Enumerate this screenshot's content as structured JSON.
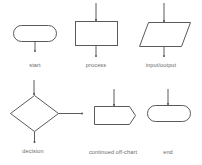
{
  "diagram": {
    "symbols": [
      {
        "id": "start",
        "label": "start",
        "shape": "terminal"
      },
      {
        "id": "process",
        "label": "process",
        "shape": "rectangle"
      },
      {
        "id": "input_output",
        "label": "input/output",
        "shape": "parallelogram"
      },
      {
        "id": "decision",
        "label": "decision",
        "shape": "diamond"
      },
      {
        "id": "continued_off_chart",
        "label": "continued off-chart",
        "shape": "pentagon"
      },
      {
        "id": "end",
        "label": "end",
        "shape": "terminal"
      }
    ],
    "colors": {
      "stroke": "#5a5a5a",
      "fill": "#ffffff",
      "label": "#6a6a6a"
    }
  }
}
